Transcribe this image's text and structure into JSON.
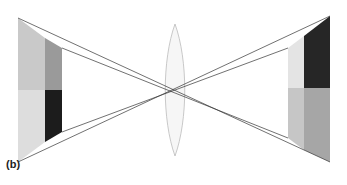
{
  "figure": {
    "panel_label": "(b)"
  },
  "colors": {
    "ray": "#333333",
    "lens_fill": "#f6f6f6",
    "lens_stroke": "#bbbbbb",
    "object_face_top": "#c9c9c9",
    "object_face_bottom": "#dddddd",
    "object_side_top": "#9a9a9a",
    "object_side_bottom": "#1c1c1c",
    "image_side_top": "#e4e4e4",
    "image_side_bottom": "#c6c6c6",
    "image_face_top": "#262626",
    "image_face_bottom": "#a6a6a6"
  },
  "elements": {
    "object": "block object (left)",
    "lens": "biconvex lens (center)",
    "image": "inverted image (right)"
  }
}
